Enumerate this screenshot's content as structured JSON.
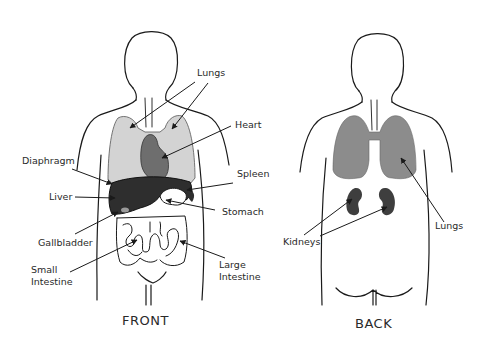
{
  "views": {
    "front": {
      "title": "FRONT",
      "labels": {
        "lungs": "Lungs",
        "heart": "Heart",
        "diaphragm": "Diaphragm",
        "spleen": "Spleen",
        "liver": "Liver",
        "stomach": "Stomach",
        "gallbladder": "Gallbladder",
        "small_intestine_1": "Small",
        "small_intestine_2": "Intestine",
        "large_intestine_1": "Large",
        "large_intestine_2": "Intestine"
      }
    },
    "back": {
      "title": "BACK",
      "labels": {
        "lungs": "Lungs",
        "kidneys": "Kidneys"
      }
    }
  },
  "colors": {
    "lungs_front": "#d3d3d3",
    "heart": "#6e6e6e",
    "liver": "#2e2e2e",
    "lungs_back": "#8c8c8c",
    "kidneys": "#3e3e3e",
    "outline": "#1a1a1a"
  }
}
